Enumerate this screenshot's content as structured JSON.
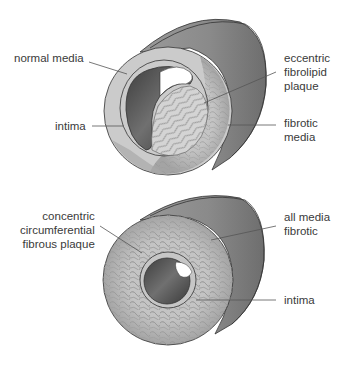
{
  "figure": {
    "panels": [
      {
        "id": "eccentric",
        "labels": {
          "normal_media": "normal media",
          "intima": "intima",
          "plaque": [
            "eccentric",
            "fibrolipid",
            "plaque"
          ],
          "fibrotic_media": [
            "fibrotic",
            "media"
          ]
        }
      },
      {
        "id": "concentric",
        "labels": {
          "plaque": [
            "concentric",
            "circumferential",
            "fibrous plaque"
          ],
          "all_media": [
            "all media",
            "fibrotic"
          ],
          "intima": "intima"
        }
      }
    ],
    "colors": {
      "tube_outer": "#8a8a8a",
      "tube_dark": "#6a6a6a",
      "media_ring": "#c9c9c9",
      "fibrous": "#b5b5b5",
      "lumen": "#555555",
      "outline": "#333333",
      "leader_line": "#555555",
      "text": "#3a3a3a"
    }
  }
}
